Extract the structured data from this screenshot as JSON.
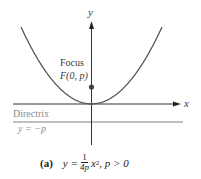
{
  "figure": {
    "axes": {
      "x_label": "x",
      "y_label": "y"
    },
    "focus": {
      "title": "Focus",
      "coord": "F(0, p)"
    },
    "directrix": {
      "title": "Directrix",
      "equation": "y = −p"
    },
    "caption": {
      "tag": "(a)",
      "lhs": "y =",
      "frac_num": "1",
      "frac_den": "4p",
      "rhs_var": "x",
      "rhs_exp": "2",
      "condition": ", p > 0"
    },
    "colors": {
      "curve": "#555555",
      "axis": "#333333",
      "directrix_line": "#aaaaaa",
      "directrix_text": "#8a8a8a",
      "focus_dot": "#444444"
    }
  }
}
